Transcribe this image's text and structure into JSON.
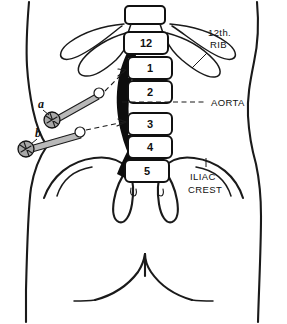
{
  "figure": {
    "view": "posterior",
    "background_color": "#ffffff",
    "ink_color": "#1a1a1a",
    "aorta_color": "#0d0d0d",
    "shade_color": "#d2d2d2"
  },
  "vertebrae": {
    "label": "vertebral column",
    "segments": [
      {
        "id": "T12",
        "number": "12",
        "cx": 146,
        "cy": 43,
        "w": 44,
        "h": 22
      },
      {
        "id": "L1",
        "number": "1",
        "cx": 150,
        "cy": 68,
        "w": 44,
        "h": 22
      },
      {
        "id": "L2",
        "number": "2",
        "cx": 150,
        "cy": 92,
        "w": 44,
        "h": 22
      },
      {
        "id": "L3",
        "number": "3",
        "cx": 150,
        "cy": 124,
        "w": 44,
        "h": 22
      },
      {
        "id": "L4",
        "number": "4",
        "cx": 150,
        "cy": 146,
        "w": 44,
        "h": 22
      },
      {
        "id": "L5",
        "number": "5",
        "cx": 147,
        "cy": 170,
        "w": 44,
        "h": 22
      }
    ]
  },
  "callouts": [
    {
      "id": "rib",
      "line1": "12th.",
      "line2": "RIB",
      "x": 208,
      "y": 36,
      "leader": "M 206 47 L 188 62"
    },
    {
      "id": "aorta",
      "line1": "AORTA",
      "line2": "",
      "x": 212,
      "y": 106,
      "leader": "M 178 102 L 206 102"
    },
    {
      "id": "iliac-crest",
      "line1": "ILIAC",
      "line2": "CREST",
      "x": 191,
      "y": 176,
      "leader": "M 206 160 L 206 168"
    }
  ],
  "markers": [
    {
      "id": "a",
      "label": "a",
      "x": 41,
      "y": 104
    },
    {
      "id": "b",
      "label": "b",
      "x": 38,
      "y": 133
    }
  ]
}
